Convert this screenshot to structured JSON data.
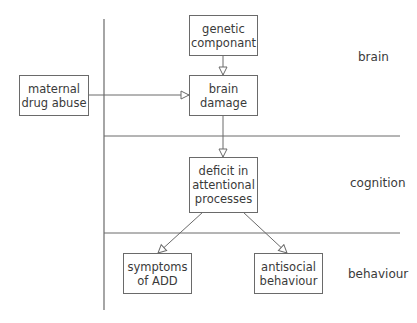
{
  "diagram": {
    "nodes": {
      "genetic": {
        "label": "genetic\ncomponant"
      },
      "maternal": {
        "label": "maternal\ndrug abuse"
      },
      "brain_damage": {
        "label": "brain\ndamage"
      },
      "deficit": {
        "label": "deficit in\nattentional\nprocesses"
      },
      "symptoms": {
        "label": "symptoms\nof ADD"
      },
      "antisocial": {
        "label": "antisocial\nbehaviour"
      }
    },
    "levels": {
      "brain": "brain",
      "cognition": "cognition",
      "behaviour": "behaviour"
    },
    "edges": [
      {
        "from": "genetic",
        "to": "brain_damage"
      },
      {
        "from": "maternal",
        "to": "brain_damage"
      },
      {
        "from": "brain_damage",
        "to": "deficit"
      },
      {
        "from": "deficit",
        "to": "symptoms"
      },
      {
        "from": "deficit",
        "to": "antisocial"
      }
    ],
    "colors": {
      "line": "#6a6a6a",
      "text": "#3a3a3a"
    }
  }
}
